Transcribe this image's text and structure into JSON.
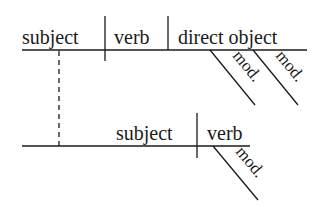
{
  "diagram": {
    "type": "sentence-diagram",
    "main_clause": {
      "subject": "subject",
      "verb": "verb",
      "direct_object": "direct object",
      "modifiers": [
        "mod.",
        "mod."
      ]
    },
    "sub_clause": {
      "subject": "subject",
      "verb": "verb",
      "modifiers": [
        "mod."
      ]
    },
    "colors": {
      "ink": "#1a1a1a",
      "background": "#ffffff"
    }
  }
}
